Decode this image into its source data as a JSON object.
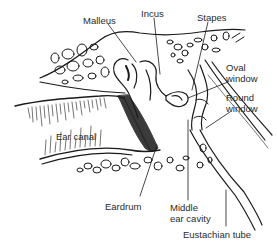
{
  "diagram": {
    "background": "#ffffff",
    "ink_color": "#1a1a1a",
    "labels": {
      "malleus": "Malleus",
      "incus": "Incus",
      "stapes": "Stapes",
      "oval_window": "Oval\nwindow",
      "round_window": "Round\nwindow",
      "ear_canal": "Ear canal",
      "eardrum": "Eardrum",
      "middle_ear_cavity": "Middle\near cavity",
      "eustachian_tube": "Eustachian tube"
    }
  }
}
